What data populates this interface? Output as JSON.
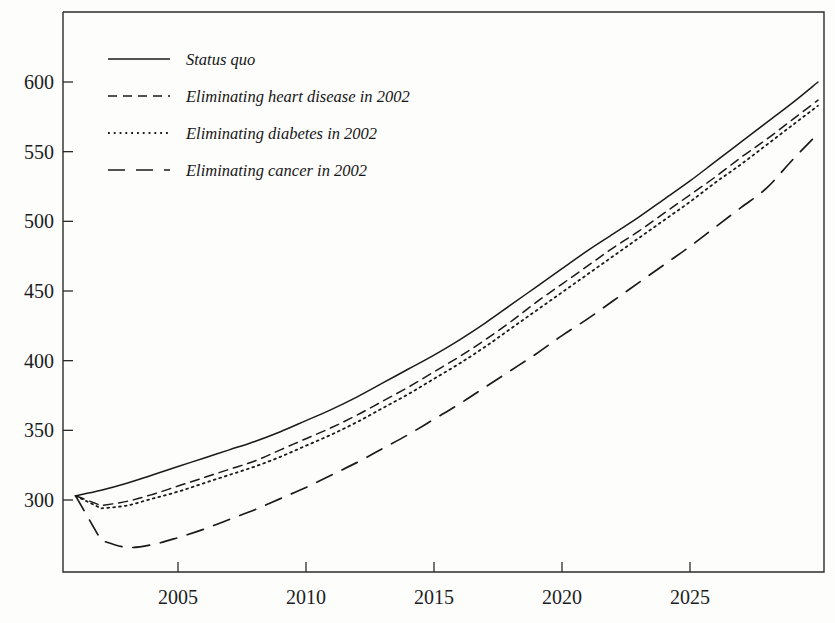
{
  "figure": {
    "background_color": "#fdfdfc",
    "line_color": "#1a1a1a",
    "axis_color": "#2b2b2b"
  },
  "chart_data": {
    "type": "line",
    "title": "",
    "subtitle": "",
    "xlabel": "",
    "ylabel": "",
    "xlim": [
      2001,
      2030
    ],
    "ylim": [
      255,
      605
    ],
    "grid": false,
    "legend_position": "top-left",
    "x_tick_labels": [
      "2005",
      "2010",
      "2015",
      "2020",
      "2025"
    ],
    "x_ticks": [
      2005,
      2010,
      2015,
      2020,
      2025
    ],
    "y_tick_labels": [
      "300",
      "350",
      "400",
      "450",
      "500",
      "550",
      "600"
    ],
    "y_ticks": [
      300,
      350,
      400,
      450,
      500,
      550,
      600
    ],
    "x": [
      2001,
      2002,
      2003,
      2004,
      2005,
      2006,
      2007,
      2008,
      2009,
      2010,
      2011,
      2012,
      2013,
      2014,
      2015,
      2016,
      2017,
      2018,
      2019,
      2020,
      2021,
      2022,
      2023,
      2024,
      2025,
      2026,
      2027,
      2028,
      2029,
      2030
    ],
    "series": [
      {
        "name": "Status quo",
        "style": "solid",
        "values": [
          303,
          307,
          312,
          318,
          324,
          330,
          336,
          342,
          349,
          357,
          365,
          374,
          384,
          394,
          404,
          415,
          427,
          440,
          453,
          466,
          479,
          491,
          503,
          516,
          529,
          543,
          557,
          571,
          585,
          600
        ]
      },
      {
        "name": "Eliminating heart disease in 2002",
        "style": "dashed",
        "values": [
          303,
          296,
          299,
          304,
          310,
          316,
          322,
          328,
          336,
          344,
          352,
          361,
          371,
          381,
          392,
          403,
          415,
          428,
          442,
          455,
          468,
          481,
          493,
          506,
          519,
          532,
          546,
          559,
          573,
          587
        ]
      },
      {
        "name": "Eliminating diabetes in 2002",
        "style": "dotted",
        "values": [
          303,
          294,
          296,
          301,
          306,
          312,
          318,
          324,
          331,
          339,
          347,
          356,
          366,
          376,
          387,
          398,
          410,
          423,
          436,
          449,
          462,
          475,
          488,
          501,
          514,
          528,
          541,
          555,
          569,
          583
        ]
      },
      {
        "name": "Eliminating cancer in 2002",
        "style": "long-dashed",
        "values": [
          303,
          271,
          266,
          268,
          273,
          279,
          286,
          293,
          301,
          309,
          318,
          327,
          337,
          347,
          358,
          369,
          381,
          393,
          405,
          418,
          430,
          443,
          456,
          469,
          482,
          496,
          510,
          524,
          544,
          563
        ]
      }
    ]
  },
  "legend": {
    "items": [
      {
        "label": "Status quo",
        "style": "solid"
      },
      {
        "label": "Eliminating heart disease in 2002",
        "style": "dashed"
      },
      {
        "label": "Eliminating diabetes in 2002",
        "style": "dotted"
      },
      {
        "label": "Eliminating cancer in 2002",
        "style": "long-dashed"
      }
    ]
  }
}
